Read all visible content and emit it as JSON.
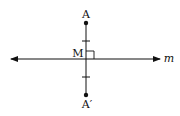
{
  "diagram": {
    "labels": {
      "point_a": "A",
      "point_a_prime": "A′",
      "midpoint": "M",
      "line": "m"
    },
    "points": {
      "A": {
        "x": 86,
        "y": 23
      },
      "A_prime": {
        "x": 86,
        "y": 95
      },
      "M": {
        "x": 86,
        "y": 59
      }
    },
    "line_m": {
      "x1": 10,
      "x2": 161,
      "y": 59,
      "arrows": "both"
    },
    "segment_AA_prime": {
      "x": 86,
      "y1": 23,
      "y2": 95
    },
    "tick_marks": [
      {
        "x": 86,
        "y": 41
      },
      {
        "x": 86,
        "y": 77
      }
    ],
    "right_angle_marker": {
      "x": 86,
      "y": 51,
      "size": 8
    },
    "colors": {
      "stroke": "#111111",
      "background": "#ffffff"
    }
  }
}
